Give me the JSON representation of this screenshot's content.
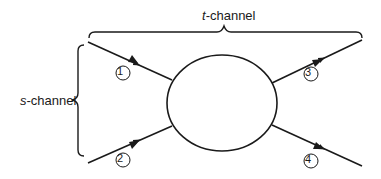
{
  "diagram": {
    "title_top": {
      "prefix": "t",
      "suffix": "-channel"
    },
    "title_left": {
      "prefix": "s",
      "suffix": "-channel"
    },
    "particles": [
      {
        "label": "1",
        "direction": "incoming"
      },
      {
        "label": "2",
        "direction": "incoming"
      },
      {
        "label": "3",
        "direction": "outgoing"
      },
      {
        "label": "4",
        "direction": "outgoing"
      }
    ],
    "center_blob": "interaction-vertex",
    "colors": {
      "stroke": "#1a1a1a",
      "background": "#ffffff"
    }
  }
}
